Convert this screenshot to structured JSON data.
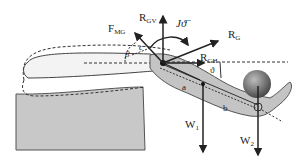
{
  "diagram": {
    "labels": {
      "f_mg": {
        "main": "F",
        "sub": "MG"
      },
      "r_gv": {
        "main": "R",
        "sub": "GV"
      },
      "r_g": {
        "main": "R",
        "sub": "G"
      },
      "r_gh": {
        "main": "R",
        "sub": "GH"
      },
      "w1": {
        "main": "W",
        "sub": "1"
      },
      "w2": {
        "main": "W",
        "sub": "2"
      },
      "moment": "Jϑ̈",
      "theta": "ϑ",
      "beta": "β",
      "c": "c",
      "a": "a",
      "b": "b"
    },
    "colors": {
      "table": "#c9c9c9",
      "arm": "#c4c4c4",
      "ball_light": "#9a9a9a",
      "ball_dark": "#555555",
      "line": "#222222"
    }
  }
}
